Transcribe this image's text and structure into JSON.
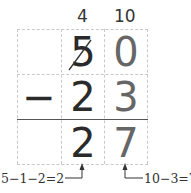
{
  "borrow_marks": {
    "tens": "4",
    "ones": "10"
  },
  "rows": [
    {
      "operator": "",
      "tens": "5",
      "ones": "0",
      "tens_struck": true
    },
    {
      "operator": "−",
      "tens": "2",
      "ones": "3"
    },
    {
      "operator": "",
      "tens": "2",
      "ones": "7"
    }
  ],
  "annotations": {
    "tens": "5−1−2=2",
    "ones": "10−3=7"
  }
}
